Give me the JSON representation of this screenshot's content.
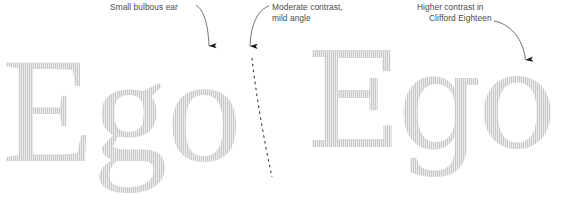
{
  "figure": {
    "background_color": "#ffffff",
    "glyph_color": "#c9c9c9",
    "annotation_color": "#4a4a4a"
  },
  "specimens": [
    {
      "id": "specimen-left",
      "text": "Ego",
      "typeface_role": "reference serif"
    },
    {
      "id": "specimen-right",
      "text": "Ego",
      "typeface_role": "Clifford Eighteen"
    }
  ],
  "annotations": [
    {
      "id": "small-bulbous-ear",
      "line1": "Small bulbous ear",
      "line2": "",
      "points_to": "lowercase g ear, left specimen"
    },
    {
      "id": "moderate-contrast",
      "line1": "Moderate contrast,",
      "line2": "mild angle",
      "points_to": "lowercase o stress axis, left specimen"
    },
    {
      "id": "higher-contrast",
      "line1": "Higher contrast in",
      "line2": "Clifford Eighteen",
      "points_to": "lowercase o, right specimen"
    }
  ],
  "overlays": {
    "stress_axis": {
      "name": "dashed-stress-axis",
      "style": "dashed",
      "description": "tilted axis of stress drawn through the left lowercase o"
    },
    "arrows": [
      {
        "name": "leader-arrow-ear"
      },
      {
        "name": "leader-arrow-contrast"
      },
      {
        "name": "leader-arrow-clifford"
      }
    ]
  }
}
